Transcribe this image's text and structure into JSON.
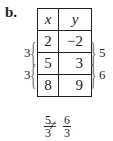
{
  "part_label": "b.",
  "table": {
    "headers": [
      "x",
      "y"
    ],
    "rows": [
      [
        "2",
        "−2"
      ],
      [
        "5",
        "3"
      ],
      [
        "8",
        "9"
      ]
    ]
  },
  "left_braces": [
    "3",
    "3"
  ],
  "right_braces": [
    "5",
    "6"
  ],
  "inequality": {
    "left": {
      "num": "5",
      "den": "3"
    },
    "symbol": "≠",
    "right": {
      "num": "6",
      "den": "3"
    }
  }
}
